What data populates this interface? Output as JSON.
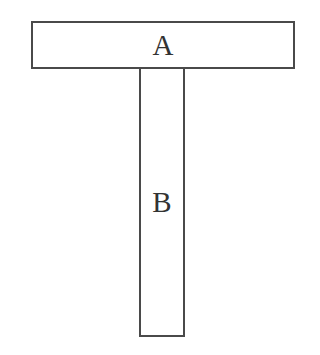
{
  "diagram": {
    "type": "T-shaped block diagram",
    "blocks": [
      {
        "id": "A",
        "label": "A",
        "orientation": "horizontal",
        "position": "top"
      },
      {
        "id": "B",
        "label": "B",
        "orientation": "vertical",
        "position": "below A, centered"
      }
    ],
    "colors": {
      "stroke": "#4a4a4a",
      "fill": "#ffffff",
      "text": "#333333"
    }
  }
}
